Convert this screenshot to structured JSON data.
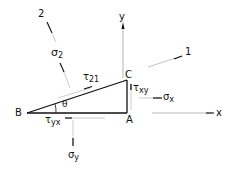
{
  "diagram": {
    "points": {
      "B": "B",
      "A": "A",
      "C": "C"
    },
    "axes": {
      "x": "x",
      "y": "y",
      "axis1": "1",
      "axis2": "2"
    },
    "angle": "θ",
    "stresses": {
      "sigma2": {
        "sym": "σ",
        "sub": "2"
      },
      "tau21": {
        "sym": "τ",
        "sub": "21"
      },
      "tauxy": {
        "sym": "τ",
        "sub": "xy"
      },
      "sigmax": {
        "sym": "σ",
        "sub": "x"
      },
      "tauyx": {
        "sym": "τ",
        "sub": "yx"
      },
      "sigmay": {
        "sym": "σ",
        "sub": "y"
      }
    },
    "colors": {
      "line": "#111111",
      "faint": "#888888",
      "background": "#ffffff"
    }
  }
}
